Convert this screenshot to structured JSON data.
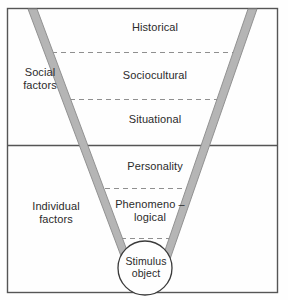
{
  "diagram": {
    "type": "funnel-diagram",
    "colors": {
      "frame_border": "#555555",
      "funnel_band": "#b5b5b5",
      "funnel_band_edge": "#8a8a8a",
      "dashed_divider": "#8f8f8f",
      "circle_stroke": "#3a3a3a",
      "text": "#2b2b2b",
      "background": "#fefefe"
    },
    "sections": [
      {
        "name": "social",
        "side_label": "Social\nfactors",
        "levels": [
          "Historical",
          "Sociocultural",
          "Situational"
        ]
      },
      {
        "name": "individual",
        "side_label": "Individual\nfactors",
        "levels": [
          "Personality",
          "Phenomeno –\nlogical"
        ]
      }
    ],
    "labels": {
      "social_factors": "Social\nfactors",
      "individual_factors": "Individual\nfactors",
      "historical": "Historical",
      "sociocultural": "Sociocultural",
      "situational": "Situational",
      "personality": "Personality",
      "phenomenological": "Phenomeno –\nlogical",
      "stimulus_object": "Stimulus\nobject"
    }
  },
  "geometry": {
    "frame": {
      "x": 7,
      "y": 8,
      "width": 271,
      "height": 285
    },
    "section_divider_y": 145,
    "funnel": {
      "left_top_x": 32,
      "right_top_x": 253,
      "left_bottom_x": 133,
      "right_bottom_x": 160,
      "top_y": 9,
      "bottom_y": 288,
      "band_width": 8
    },
    "dashed_lines": [
      {
        "y": 52,
        "x1": 52,
        "x2": 238
      },
      {
        "y": 99,
        "x1": 70,
        "x2": 221
      },
      {
        "y": 188,
        "x1": 105,
        "x2": 190
      },
      {
        "y": 238,
        "x1": 121,
        "x2": 176
      }
    ],
    "circle": {
      "cx": 145,
      "cy": 268,
      "r": 27
    }
  }
}
